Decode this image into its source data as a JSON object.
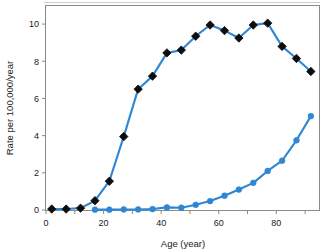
{
  "chart_data": {
    "type": "line",
    "title": "",
    "xlabel": "Age (year)",
    "ylabel": "Rate per 100,000/year",
    "xlim": [
      0,
      95
    ],
    "ylim": [
      0,
      11
    ],
    "xticks": [
      0,
      20,
      40,
      60,
      80
    ],
    "yticks": [
      0,
      2,
      4,
      6,
      8,
      10
    ],
    "xtick_labels": [
      "0",
      "20",
      "40",
      "60",
      "80"
    ],
    "ytick_labels": [
      "0",
      "2",
      "4",
      "6",
      "8",
      "10"
    ],
    "grid": false,
    "legend": "none",
    "series": [
      {
        "name": "black-diamond-series",
        "marker": "diamond",
        "marker_color": "#0d0d0d",
        "line_color": "#2E86D4",
        "x": [
          2,
          7,
          12,
          17,
          22,
          27,
          32,
          37,
          42,
          47,
          52,
          57,
          62,
          67,
          72,
          77,
          82,
          87,
          92
        ],
        "y": [
          0.05,
          0.05,
          0.1,
          0.5,
          1.55,
          3.95,
          6.5,
          7.2,
          8.45,
          8.6,
          9.35,
          9.95,
          9.65,
          9.25,
          9.95,
          10.05,
          8.8,
          8.15,
          7.45
        ]
      },
      {
        "name": "blue-circle-series",
        "marker": "circle",
        "marker_color": "#2E86D4",
        "line_color": "#2E86D4",
        "x": [
          17,
          22,
          27,
          32,
          37,
          42,
          47,
          52,
          57,
          62,
          67,
          72,
          77,
          82,
          87,
          92
        ],
        "y": [
          0.02,
          0.02,
          0.03,
          0.03,
          0.05,
          0.14,
          0.12,
          0.28,
          0.48,
          0.77,
          1.1,
          1.46,
          2.1,
          2.65,
          3.75,
          5.05
        ]
      }
    ]
  },
  "axes": {
    "frame_color": "#8a8a8a",
    "accent_blue": "#2E86D4",
    "marker_black": "#0d0d0d"
  }
}
